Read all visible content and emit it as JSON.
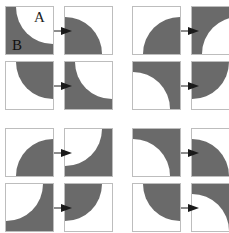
{
  "colors": {
    "fill": "#6a6a6a",
    "background": "#ffffff",
    "border": "#bdbdbd",
    "arrow": "#1a1a1a"
  },
  "labels": {
    "a": "A",
    "b": "B"
  },
  "panels": [
    {
      "name": "top-left",
      "pairs": [
        {
          "from": {
            "bg": "fill",
            "corner": "tr"
          },
          "to": {
            "bg": "bg",
            "corner": "bl"
          }
        },
        {
          "from": {
            "bg": "bg",
            "corner": "tr"
          },
          "to": {
            "bg": "fill",
            "corner": "tr"
          }
        }
      ]
    },
    {
      "name": "top-right",
      "pairs": [
        {
          "from": {
            "bg": "bg",
            "corner": "br"
          },
          "to": {
            "bg": "fill",
            "corner": "br"
          }
        },
        {
          "from": {
            "bg": "fill",
            "corner": "bl"
          },
          "to": {
            "bg": "bg",
            "corner": "tl"
          }
        }
      ]
    },
    {
      "name": "bottom-left",
      "pairs": [
        {
          "from": {
            "bg": "bg",
            "corner": "br"
          },
          "to": {
            "bg": "fill",
            "corner": "tl"
          }
        },
        {
          "from": {
            "bg": "fill",
            "corner": "tl"
          },
          "to": {
            "bg": "bg",
            "corner": "tl"
          }
        }
      ]
    },
    {
      "name": "bottom-right",
      "pairs": [
        {
          "from": {
            "bg": "fill",
            "corner": "bl"
          },
          "to": {
            "bg": "bg",
            "corner": "bl"
          }
        },
        {
          "from": {
            "bg": "bg",
            "corner": "tr"
          },
          "to": {
            "bg": "fill",
            "corner": "bl"
          }
        }
      ]
    }
  ]
}
